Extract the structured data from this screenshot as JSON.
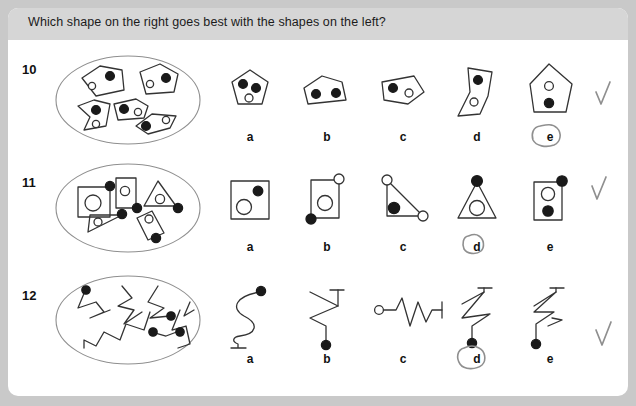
{
  "header": {
    "title": "Which shape on the right goes best with the shapes on the left?"
  },
  "colors": {
    "page_background": "#c9c9c9",
    "card_background": "#ffffff",
    "header_band": "#d6d6d6",
    "ink": "#333333",
    "dot_filled": "#1a1a1a",
    "dot_open": "#ffffff",
    "oval_outline": "#8a8a8a",
    "pencil_mark": "#8f8f8f",
    "text": "#111111"
  },
  "questions": [
    {
      "number": "10",
      "prompt_group": "five irregular polygons, each containing one filled dot and one open circle",
      "options": [
        {
          "label": "a",
          "description": "pentagon with two filled dots and one open circle inside",
          "circled": false
        },
        {
          "label": "b",
          "description": "wide quadrilateral with two filled dots inside",
          "circled": false
        },
        {
          "label": "c",
          "description": "quadrilateral with one filled dot and one open circle inside",
          "circled": false
        },
        {
          "label": "d",
          "description": "arrow-like concave polygon with one filled dot and one open circle inside",
          "circled": false
        },
        {
          "label": "e",
          "description": "pentagon with one open circle and one filled dot inside",
          "circled": true
        }
      ],
      "checkmark": true,
      "selected": "e"
    },
    {
      "number": "11",
      "prompt_group": "squares, rectangles and triangles, each with an open circle inside and a filled dot on the outline",
      "options": [
        {
          "label": "a",
          "description": "square with open circle inside and filled dot inside",
          "circled": false
        },
        {
          "label": "b",
          "description": "rectangle with open circle inside, open circle on top corner, filled dot on bottom corner",
          "circled": false
        },
        {
          "label": "c",
          "description": "right triangle with filled dot inside and open circles at two corners",
          "circled": false
        },
        {
          "label": "d",
          "description": "triangle with open circle inside and filled dot on apex",
          "circled": true
        },
        {
          "label": "e",
          "description": "rectangle with open circle and filled dot inside, filled dot on top corner",
          "circled": false
        }
      ],
      "checkmark": true,
      "selected": "d"
    },
    {
      "number": "12",
      "prompt_group": "zigzag and squiggly lines, each ending with one filled dot",
      "options": [
        {
          "label": "a",
          "description": "smooth S-curve with filled dot at top end and flat bar at bottom",
          "circled": false
        },
        {
          "label": "b",
          "description": "zigzag with flat bar at top and filled dot at bottom",
          "circled": false
        },
        {
          "label": "c",
          "description": "zigzag with open circle at left end and flat bar at right",
          "circled": false
        },
        {
          "label": "d",
          "description": "zigzag with flat bar at top and filled dot at bottom",
          "circled": true
        },
        {
          "label": "e",
          "description": "zigzag with flat bar at top and filled dot at bottom",
          "circled": false
        }
      ],
      "checkmark": true,
      "selected": "d"
    }
  ]
}
